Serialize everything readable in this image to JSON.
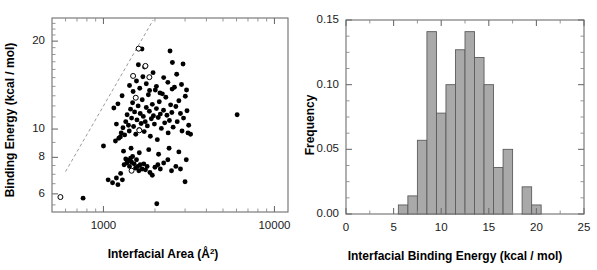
{
  "figure": {
    "background": "#ffffff",
    "panel_count": 2
  },
  "chart_data": [
    {
      "id": "scatter-binding-energy-vs-area",
      "type": "scatter",
      "title": "",
      "xlabel": "Interfacial Area (Å²)",
      "xlabel_base": "Interfacial Area (Å",
      "xlabel_sup": "2",
      "xlabel_tail": ")",
      "ylabel": "Binding Energy (kcal / mol)",
      "xscale": "log",
      "yscale": "log",
      "xlim": [
        500,
        12000
      ],
      "ylim": [
        5.2,
        24
      ],
      "xticks": [
        1000,
        10000
      ],
      "xticklabels": [
        "1000",
        "10000"
      ],
      "yticks": [
        6,
        8,
        10,
        20
      ],
      "yticklabels": [
        "6",
        "8",
        "10",
        "20"
      ],
      "grid": false,
      "legend": "none",
      "series": [
        {
          "name": "complexes-filled",
          "marker": "filled-circle",
          "color": "#000000",
          "points": [
            [
              760,
              5.8
            ],
            [
              2050,
              5.55
            ],
            [
              1000,
              8.75
            ],
            [
              1065,
              6.7
            ],
            [
              1130,
              6.55
            ],
            [
              1190,
              6.8
            ],
            [
              1215,
              6.45
            ],
            [
              1260,
              7.05
            ],
            [
              1290,
              6.7
            ],
            [
              1320,
              7.55
            ],
            [
              1350,
              7.9
            ],
            [
              1370,
              7.65
            ],
            [
              1395,
              7.8
            ],
            [
              1420,
              7.45
            ],
            [
              1440,
              7.95
            ],
            [
              1460,
              7.7
            ],
            [
              1480,
              8.05
            ],
            [
              1510,
              7.6
            ],
            [
              1540,
              7.35
            ],
            [
              1560,
              7.85
            ],
            [
              1585,
              7.45
            ],
            [
              1610,
              7.2
            ],
            [
              1640,
              7.55
            ],
            [
              1680,
              7.3
            ],
            [
              1720,
              7.6
            ],
            [
              1760,
              7.25
            ],
            [
              1800,
              7.45
            ],
            [
              1870,
              7.1
            ],
            [
              1930,
              6.95
            ],
            [
              2000,
              7.4
            ],
            [
              2080,
              7.55
            ],
            [
              2150,
              7.3
            ],
            [
              2250,
              7.65
            ],
            [
              2380,
              7.85
            ],
            [
              2500,
              7.2
            ],
            [
              2650,
              7.45
            ],
            [
              2820,
              7.3
            ],
            [
              3000,
              6.6
            ],
            [
              3050,
              7.85
            ],
            [
              1230,
              9.3
            ],
            [
              1270,
              9.7
            ],
            [
              1300,
              10.1
            ],
            [
              1330,
              9.55
            ],
            [
              1350,
              10.6
            ],
            [
              1375,
              11.2
            ],
            [
              1400,
              10.3
            ],
            [
              1415,
              9.85
            ],
            [
              1440,
              11.7
            ],
            [
              1460,
              10.9
            ],
            [
              1480,
              12.3
            ],
            [
              1500,
              10.2
            ],
            [
              1520,
              11.45
            ],
            [
              1545,
              9.6
            ],
            [
              1570,
              10.75
            ],
            [
              1595,
              12.0
            ],
            [
              1615,
              9.95
            ],
            [
              1640,
              11.3
            ],
            [
              1660,
              10.45
            ],
            [
              1685,
              12.6
            ],
            [
              1710,
              11.05
            ],
            [
              1730,
              9.8
            ],
            [
              1755,
              10.6
            ],
            [
              1780,
              11.85
            ],
            [
              1805,
              10.25
            ],
            [
              1830,
              13.1
            ],
            [
              1855,
              11.5
            ],
            [
              1880,
              9.45
            ],
            [
              1905,
              10.85
            ],
            [
              1930,
              12.15
            ],
            [
              1960,
              11.1
            ],
            [
              1985,
              10.4
            ],
            [
              2010,
              13.6
            ],
            [
              2040,
              11.75
            ],
            [
              2065,
              9.2
            ],
            [
              2090,
              10.95
            ],
            [
              2120,
              12.4
            ],
            [
              2150,
              11.25
            ],
            [
              2180,
              10.05
            ],
            [
              2210,
              13.2
            ],
            [
              2245,
              11.6
            ],
            [
              2280,
              10.5
            ],
            [
              2315,
              12.85
            ],
            [
              2350,
              11.15
            ],
            [
              2390,
              9.7
            ],
            [
              2430,
              10.7
            ],
            [
              2470,
              12.1
            ],
            [
              2510,
              11.4
            ],
            [
              2555,
              10.15
            ],
            [
              2600,
              13.9
            ],
            [
              2650,
              11.95
            ],
            [
              2700,
              10.6
            ],
            [
              2760,
              12.5
            ],
            [
              2820,
              11.3
            ],
            [
              2880,
              9.85
            ],
            [
              2940,
              10.9
            ],
            [
              3010,
              12.95
            ],
            [
              3080,
              11.55
            ],
            [
              3150,
              10.3
            ],
            [
              3230,
              9.6
            ],
            [
              1420,
              14.1
            ],
            [
              1490,
              13.45
            ],
            [
              1560,
              14.6
            ],
            [
              1630,
              13.8
            ],
            [
              1700,
              15.1
            ],
            [
              1780,
              14.3
            ],
            [
              1860,
              13.55
            ],
            [
              1950,
              15.6
            ],
            [
              2040,
              14.0
            ],
            [
              2140,
              13.3
            ],
            [
              2250,
              15.0
            ],
            [
              2380,
              14.45
            ],
            [
              2520,
              13.7
            ],
            [
              2680,
              15.4
            ],
            [
              2860,
              14.2
            ],
            [
              3060,
              13.6
            ],
            [
              1680,
              18.8
            ],
            [
              2450,
              18.5
            ],
            [
              1600,
              16.6
            ],
            [
              1740,
              16.3
            ],
            [
              2530,
              16.9
            ],
            [
              2920,
              16.7
            ],
            [
              6050,
              11.2
            ],
            [
              1150,
              11.8
            ],
            [
              1190,
              10.4
            ],
            [
              1215,
              12.2
            ],
            [
              1255,
              9.4
            ],
            [
              1285,
              13.0
            ],
            [
              1175,
              9.1
            ],
            [
              1310,
              8.4
            ],
            [
              1450,
              8.6
            ],
            [
              1620,
              8.3
            ],
            [
              1840,
              8.5
            ],
            [
              2100,
              8.2
            ],
            [
              2420,
              8.6
            ],
            [
              2760,
              8.35
            ],
            [
              3120,
              9.7
            ]
          ]
        },
        {
          "name": "outliers-open",
          "marker": "open-circle",
          "color": "#000000",
          "points": [
            [
              560,
              5.85
            ],
            [
              1605,
              18.85
            ],
            [
              1760,
              16.45
            ],
            [
              1490,
              15.2
            ],
            [
              1855,
              15.05
            ],
            [
              1545,
              12.8
            ],
            [
              1620,
              9.9
            ],
            [
              1460,
              7.2
            ]
          ]
        }
      ],
      "annotations": [
        {
          "type": "dashed-line",
          "name": "upper-bound-trendline",
          "color": "#9a9a9a",
          "from": [
            600,
            7.15
          ],
          "to": [
            1950,
            23.6
          ]
        }
      ]
    },
    {
      "id": "histogram-binding-energy",
      "type": "bar",
      "title": "",
      "xlabel": "Interfacial Binding Energy (kcal / mol)",
      "ylabel": "Frequency",
      "xscale": "linear",
      "yscale": "linear",
      "xlim": [
        0,
        25
      ],
      "ylim": [
        0,
        0.15
      ],
      "xticks": [
        0,
        5,
        10,
        15,
        20,
        25
      ],
      "xticklabels": [
        "0",
        "5",
        "10",
        "15",
        "20",
        "25"
      ],
      "yticks": [
        0.0,
        0.05,
        0.1,
        0.15
      ],
      "yticklabels": [
        "0.00",
        "0.05",
        "0.10",
        "0.15"
      ],
      "grid": false,
      "legend": "none",
      "bin_width": 1,
      "bar_color": "#a9a9a9",
      "bar_edge_color": "#5c5c5c",
      "bins": [
        {
          "x0": 5.5,
          "x1": 6.5,
          "value": 0.007
        },
        {
          "x0": 6.5,
          "x1": 7.5,
          "value": 0.014
        },
        {
          "x0": 7.5,
          "x1": 8.5,
          "value": 0.057
        },
        {
          "x0": 8.5,
          "x1": 9.5,
          "value": 0.141
        },
        {
          "x0": 9.5,
          "x1": 10.5,
          "value": 0.078
        },
        {
          "x0": 10.5,
          "x1": 11.5,
          "value": 0.1
        },
        {
          "x0": 11.5,
          "x1": 12.5,
          "value": 0.127
        },
        {
          "x0": 12.5,
          "x1": 13.5,
          "value": 0.141
        },
        {
          "x0": 13.5,
          "x1": 14.5,
          "value": 0.121
        },
        {
          "x0": 14.5,
          "x1": 15.5,
          "value": 0.1
        },
        {
          "x0": 15.5,
          "x1": 16.5,
          "value": 0.036
        },
        {
          "x0": 16.5,
          "x1": 17.5,
          "value": 0.05
        },
        {
          "x0": 18.5,
          "x1": 19.5,
          "value": 0.021
        },
        {
          "x0": 19.5,
          "x1": 20.5,
          "value": 0.007
        }
      ]
    }
  ]
}
